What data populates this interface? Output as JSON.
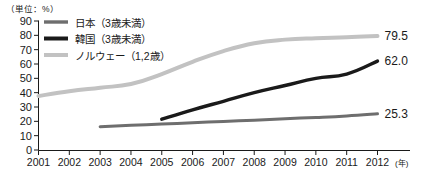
{
  "chart_data": {
    "type": "line",
    "title": "",
    "subtitle": "",
    "unit_label": "（単位：%）",
    "xlabel": "(年)",
    "ylabel": "",
    "grid": false,
    "legend_position": "top-left",
    "x": [
      2001,
      2002,
      2003,
      2004,
      2005,
      2006,
      2007,
      2008,
      2009,
      2010,
      2011,
      2012
    ],
    "categories": [
      "2001",
      "2002",
      "2003",
      "2004",
      "2005",
      "2006",
      "2007",
      "2008",
      "2009",
      "2010",
      "2011",
      "2012"
    ],
    "xlim": [
      2001,
      2012
    ],
    "ylim": [
      0,
      90
    ],
    "yticks": [
      "0",
      "10",
      "20",
      "30",
      "40",
      "50",
      "60",
      "70",
      "80",
      "90"
    ],
    "ytick_values": [
      0,
      10,
      20,
      30,
      40,
      50,
      60,
      70,
      80,
      90
    ],
    "series": [
      {
        "name": "日本（3歳未満）",
        "key": "japan",
        "color": "#6e6e6e",
        "width": 3.0,
        "start_year": 2003,
        "end_label": "25.3",
        "x": [
          2003,
          2004,
          2005,
          2006,
          2007,
          2008,
          2009,
          2010,
          2011,
          2012
        ],
        "values": [
          16.3,
          17.2,
          18.1,
          19.0,
          19.9,
          20.8,
          21.8,
          22.7,
          23.8,
          25.3
        ]
      },
      {
        "name": "韓国（3歳未満）",
        "key": "korea",
        "color": "#1a1a1a",
        "width": 3.4,
        "start_year": 2005,
        "end_label": "62.0",
        "x": [
          2005,
          2006,
          2007,
          2008,
          2009,
          2010,
          2011,
          2012
        ],
        "values": [
          21.5,
          28.0,
          34.0,
          40.0,
          45.0,
          50.0,
          53.0,
          62.0
        ]
      },
      {
        "name": "ノルウェー（1,2歳）",
        "key": "norway",
        "color": "#c2c2c2",
        "width": 4.0,
        "start_year": 2001,
        "end_label": "79.5",
        "x": [
          2001,
          2002,
          2003,
          2004,
          2005,
          2006,
          2007,
          2008,
          2009,
          2010,
          2011,
          2012
        ],
        "values": [
          37.7,
          41.0,
          43.5,
          46.0,
          53.0,
          61.5,
          69.0,
          74.5,
          77.0,
          78.0,
          78.6,
          79.5
        ]
      }
    ],
    "end_labels": [
      {
        "text": "79.5",
        "series": "norway"
      },
      {
        "text": "62.0",
        "series": "korea"
      },
      {
        "text": "25.3",
        "series": "japan"
      }
    ],
    "legend": [
      {
        "label": "日本（3歳未満）",
        "color": "#6e6e6e"
      },
      {
        "label": "韓国（3歳未満）",
        "color": "#1a1a1a"
      },
      {
        "label": "ノルウェー（1,2歳）",
        "color": "#c2c2c2"
      }
    ]
  }
}
